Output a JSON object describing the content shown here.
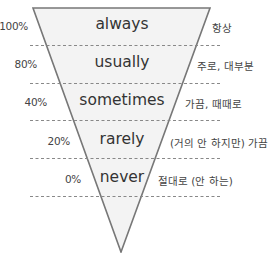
{
  "colors": {
    "fill": "#f3f3f3",
    "stroke": "#777777",
    "dash": "#888888",
    "text": "#333333"
  },
  "levels": [
    {
      "percent": "100%",
      "word": "always",
      "korean": "항상"
    },
    {
      "percent": "80%",
      "word": "usually",
      "korean": "주로, 대부분"
    },
    {
      "percent": "40%",
      "word": "sometimes",
      "korean": "가끔, 때때로"
    },
    {
      "percent": "20%",
      "word": "rarely",
      "korean": "(거의 안 하지만) 가끔"
    },
    {
      "percent": "0%",
      "word": "never",
      "korean": "절대로 (안 하는)"
    }
  ]
}
